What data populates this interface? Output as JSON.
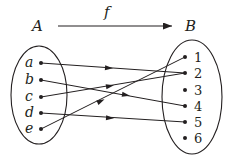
{
  "diagram": {
    "type": "function-mapping",
    "function_label": "f",
    "domain": {
      "label": "A",
      "elements": [
        "a",
        "b",
        "c",
        "d",
        "e"
      ]
    },
    "codomain": {
      "label": "B",
      "elements": [
        "1",
        "2",
        "3",
        "4",
        "5",
        "6"
      ]
    },
    "mappings": [
      {
        "from": "a",
        "to": "2"
      },
      {
        "from": "b",
        "to": "4"
      },
      {
        "from": "c",
        "to": "2"
      },
      {
        "from": "d",
        "to": "5"
      },
      {
        "from": "e",
        "to": "1"
      }
    ],
    "colors": {
      "ink": "#231f20",
      "background": "#ffffff"
    }
  }
}
